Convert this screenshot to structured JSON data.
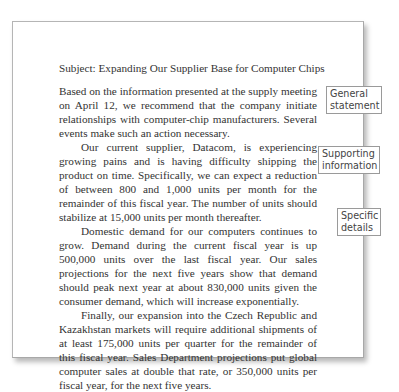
{
  "document": {
    "subject": "Subject: Expanding Our Supplier Base for Computer Chips",
    "paragraphs": [
      "Based on the information presented at the supply meeting on April 12, we recommend that the company initiate relationships with computer-chip manufacturers. Several events make such an action necessary.",
      "Our current supplier, Datacom, is experiencing growing pains and is having difficulty shipping the product on time. Specifically, we can expect a reduction of between 800 and 1,000 units per month for the remainder of this fiscal year. The number of units should stabilize at 15,000 units per month thereafter.",
      "Domestic demand for our computers continues to grow. Demand during the current fiscal year is up 500,000 units over the last fiscal year. Our sales projections for the next five years show that demand should peak next year at about 830,000 units given the consumer demand, which will increase exponentially.",
      "Finally, our expansion into the Czech Republic and Kazakhstan markets will require additional shipments of at least 175,000 units per quarter for the remainder of this fiscal year. Sales Department projections put global computer sales at double that rate, or 350,000 units per fiscal year, for the next five years."
    ]
  },
  "annotations": {
    "general": {
      "line1": "General",
      "line2": "statement"
    },
    "supporting": {
      "line1": "Supporting",
      "line2": "information"
    },
    "specific": {
      "line1": "Specific",
      "line2": "details"
    }
  }
}
